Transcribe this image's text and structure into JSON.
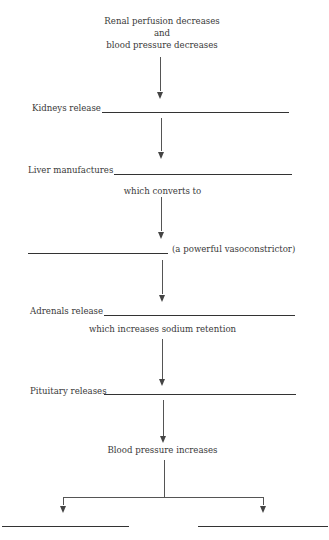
{
  "diagram": {
    "title_lines": [
      "Renal perfusion decreases",
      "and",
      "blood pressure decreases"
    ],
    "steps": [
      {
        "label": "Kidneys release",
        "blank": ""
      },
      {
        "label": "Liver manufactures",
        "blank": "",
        "note": "which converts to"
      },
      {
        "label": "",
        "blank": "",
        "suffix": "(a powerful vasoconstrictor)"
      },
      {
        "label": "Adrenals release",
        "blank": "",
        "note": "which increases sodium retention"
      },
      {
        "label": "Pituitary releases",
        "blank": ""
      }
    ],
    "outcome": "Blood pressure increases",
    "branches": [
      {
        "blank": ""
      },
      {
        "blank": ""
      }
    ]
  }
}
